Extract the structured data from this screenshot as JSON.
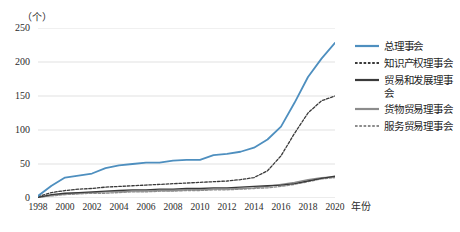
{
  "header": {
    "clipped_caption": ""
  },
  "axes": {
    "y_unit": "（个）",
    "x_title": "年份",
    "y_ticks": [
      "0",
      "50",
      "100",
      "150",
      "200",
      "250"
    ],
    "x_ticks": [
      "1998",
      "2000",
      "2002",
      "2004",
      "2006",
      "2008",
      "2010",
      "2012",
      "2014",
      "2016",
      "2018",
      "2020"
    ]
  },
  "colors": {
    "series_blue": "#4E8FBF",
    "series_dark": "#3A3A3A",
    "series_gray": "#8C8C8C",
    "gridline": "#D9D9D9",
    "text": "#2B2B2B"
  },
  "legend": {
    "items": [
      {
        "label": "总理事会",
        "color": "#4E8FBF",
        "style": "solid"
      },
      {
        "label": "知识产权理事会",
        "color": "#3A3A3A",
        "style": "dashed"
      },
      {
        "label": "贸易和发展理事会",
        "color": "#3A3A3A",
        "style": "solid"
      },
      {
        "label": "货物贸易理事会",
        "color": "#8C8C8C",
        "style": "solid"
      },
      {
        "label": "服务贸易理事会",
        "color": "#8C8C8C",
        "style": "dashed"
      }
    ]
  },
  "chart_data": {
    "type": "line",
    "title": "",
    "xlabel": "年份",
    "ylabel": "（个）",
    "ylim": [
      0,
      250
    ],
    "xlim": [
      1998,
      2020
    ],
    "grid": true,
    "legend_position": "right",
    "x": [
      1998,
      1999,
      2000,
      2001,
      2002,
      2003,
      2004,
      2005,
      2006,
      2007,
      2008,
      2009,
      2010,
      2011,
      2012,
      2013,
      2014,
      2015,
      2016,
      2017,
      2018,
      2019,
      2020
    ],
    "series": [
      {
        "name": "总理事会",
        "color": "#4E8FBF",
        "style": "solid",
        "values": [
          3,
          18,
          30,
          33,
          36,
          44,
          48,
          50,
          52,
          52,
          55,
          56,
          56,
          63,
          65,
          68,
          74,
          86,
          105,
          140,
          178,
          205,
          228
        ]
      },
      {
        "name": "知识产权理事会",
        "color": "#3A3A3A",
        "style": "dashed",
        "values": [
          2,
          8,
          11,
          13,
          14,
          16,
          17,
          18,
          19,
          20,
          21,
          22,
          23,
          24,
          25,
          27,
          30,
          40,
          62,
          95,
          125,
          143,
          150
        ]
      },
      {
        "name": "贸易和发展理事会",
        "color": "#3A3A3A",
        "style": "solid",
        "values": [
          1,
          5,
          7,
          8,
          9,
          10,
          11,
          12,
          12,
          13,
          13,
          14,
          14,
          15,
          15,
          16,
          17,
          18,
          19,
          21,
          25,
          29,
          32
        ]
      },
      {
        "name": "货物贸易理事会",
        "color": "#8C8C8C",
        "style": "solid",
        "values": [
          1,
          4,
          6,
          7,
          8,
          9,
          9,
          10,
          10,
          11,
          11,
          12,
          12,
          13,
          13,
          14,
          15,
          17,
          20,
          23,
          27,
          30,
          31
        ]
      },
      {
        "name": "服务贸易理事会",
        "color": "#8C8C8C",
        "style": "dashed",
        "values": [
          1,
          3,
          5,
          6,
          7,
          7,
          8,
          9,
          9,
          10,
          10,
          11,
          11,
          12,
          12,
          13,
          14,
          15,
          17,
          20,
          24,
          28,
          30
        ]
      }
    ]
  }
}
